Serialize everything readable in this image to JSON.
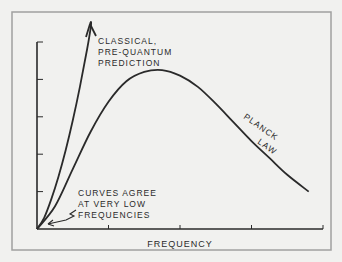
{
  "chart_data": {
    "type": "line",
    "title": "",
    "xlabel": "FREQUENCY",
    "ylabel": "RADIATED INTENSITY",
    "xlim": [
      0,
      4
    ],
    "ylim": [
      0,
      5
    ],
    "x_ticks": [
      1,
      2,
      3,
      4
    ],
    "y_ticks": [
      1,
      2,
      3,
      4,
      5
    ],
    "grid": false,
    "series": [
      {
        "name": "Classical, pre-quantum prediction",
        "x": [
          0,
          0.1,
          0.2,
          0.3,
          0.4,
          0.5,
          0.6,
          0.7,
          0.8
        ],
        "y": [
          0,
          0.3,
          0.8,
          1.4,
          2.1,
          2.9,
          3.8,
          4.8,
          5.9
        ]
      },
      {
        "name": "Planck law",
        "x": [
          0,
          0.25,
          0.5,
          0.75,
          1.0,
          1.25,
          1.5,
          1.75,
          2.0,
          2.25,
          2.5,
          2.75,
          3.0,
          3.25,
          3.5,
          3.8
        ],
        "y": [
          0,
          0.6,
          1.6,
          2.6,
          3.4,
          3.95,
          4.2,
          4.25,
          4.1,
          3.8,
          3.35,
          2.85,
          2.35,
          1.9,
          1.45,
          1.0
        ]
      }
    ],
    "annotations": {
      "classical": [
        "CLASSICAL,",
        "PRE-QUANTUM",
        "PREDICTION"
      ],
      "planck": "PLANCK LAW",
      "planck_word1": "PLANCK",
      "planck_word2": "LAW",
      "agree": [
        "CURVES AGREE",
        "AT VERY LOW",
        "FREQUENCIES"
      ]
    }
  },
  "colors": {
    "ink": "#2a2a2a",
    "background": "#f1f1ef",
    "frame": "#9a9a9a"
  }
}
